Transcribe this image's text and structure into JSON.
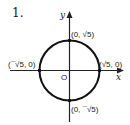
{
  "problem": {
    "number": "1."
  },
  "axes": {
    "x_label": "x",
    "y_label": "y",
    "origin_label": "O"
  },
  "circle": {
    "center": "(0, 0)",
    "radius": "√5"
  },
  "points": {
    "top": "(0, √5)",
    "bottom": "(0, ¯√5)",
    "left": "(¯√5, 0)",
    "right": "(√5, 0)"
  }
}
